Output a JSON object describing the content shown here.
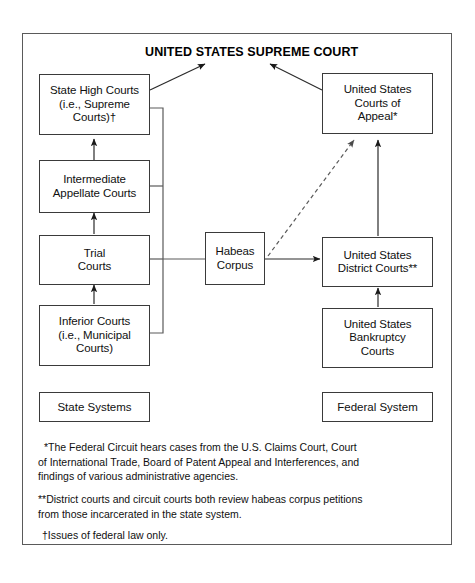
{
  "diagram": {
    "title": "UNITED STATES SUPREME COURT",
    "nodes": {
      "state_high_courts": "State High Courts\n(i.e., Supreme\nCourts)†",
      "intermediate_appellate_courts": "Intermediate\nAppellate Courts",
      "trial_courts": "Trial\nCourts",
      "inferior_courts": "Inferior Courts\n(i.e., Municipal\nCourts)",
      "habeas_corpus": "Habeas\nCorpus",
      "us_courts_of_appeal": "United States\nCourts of\nAppeal*",
      "us_district_courts": "United States\nDistrict Courts**",
      "us_bankruptcy_courts": "United States\nBankruptcy\nCourts"
    },
    "legend": {
      "state": "State Systems",
      "federal": "Federal System"
    },
    "notes": {
      "asterisk": "*The Federal Circuit hears cases from the U.S. Claims Court, Court of International Trade, Board of Patent Appeal and Interferences, and findings of various administrative agencies.",
      "double_asterisk": "**District courts and circuit courts both review habeas corpus petitions from those incarcerated in the state system.",
      "dagger": "†Issues of federal law only."
    },
    "colors": {
      "line": "#3a3a3a",
      "frame": "#5a5a5a",
      "text": "#101010",
      "background": "#ffffff"
    }
  }
}
